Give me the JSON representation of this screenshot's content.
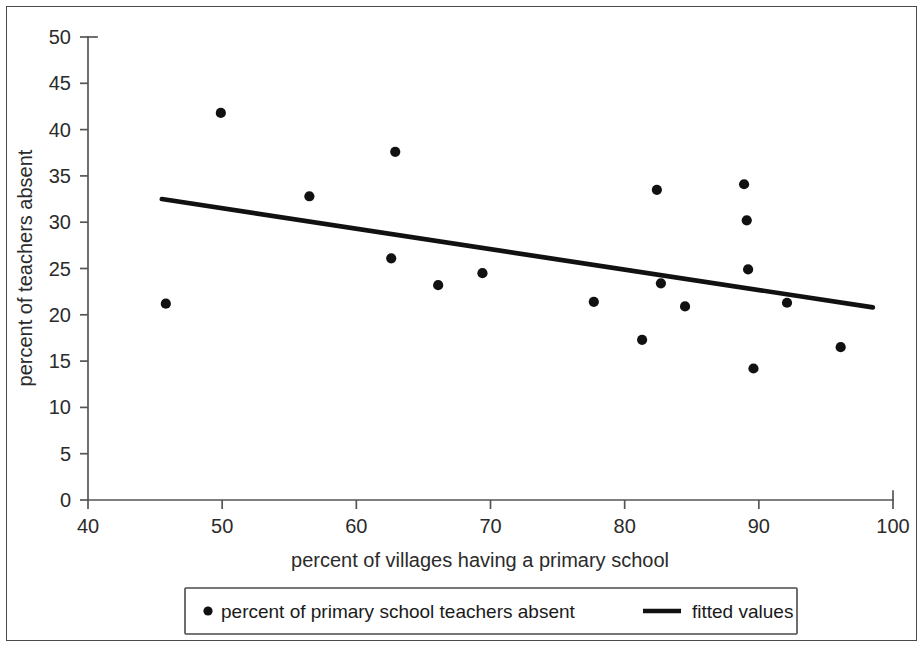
{
  "chart_data": {
    "type": "scatter",
    "title": "",
    "subtitle": "",
    "xlabel": "percent of villages having a primary school",
    "ylabel": "percent of teachers absent",
    "xlim": [
      40,
      100
    ],
    "ylim": [
      0,
      50
    ],
    "xticks": [
      40,
      50,
      60,
      70,
      80,
      90,
      100
    ],
    "yticks": [
      0,
      5,
      10,
      15,
      20,
      25,
      30,
      35,
      40,
      45,
      50
    ],
    "grid": false,
    "legend_position": "below-axis-centered",
    "series": [
      {
        "name": "percent of primary school teachers absent",
        "type": "scatter",
        "marker": "circle",
        "color": "#111111",
        "points": [
          {
            "x": 45.8,
            "y": 21.2
          },
          {
            "x": 49.9,
            "y": 41.8
          },
          {
            "x": 56.5,
            "y": 32.8
          },
          {
            "x": 62.9,
            "y": 37.6
          },
          {
            "x": 62.6,
            "y": 26.1
          },
          {
            "x": 66.1,
            "y": 23.2
          },
          {
            "x": 69.4,
            "y": 24.5
          },
          {
            "x": 77.7,
            "y": 21.4
          },
          {
            "x": 81.3,
            "y": 17.3
          },
          {
            "x": 82.4,
            "y": 33.5
          },
          {
            "x": 82.7,
            "y": 23.4
          },
          {
            "x": 84.5,
            "y": 20.9
          },
          {
            "x": 88.9,
            "y": 34.1
          },
          {
            "x": 89.1,
            "y": 30.2
          },
          {
            "x": 89.2,
            "y": 24.9
          },
          {
            "x": 89.6,
            "y": 14.2
          },
          {
            "x": 92.1,
            "y": 21.3
          },
          {
            "x": 96.1,
            "y": 16.5
          }
        ]
      },
      {
        "name": "fitted values",
        "type": "line",
        "color": "#111111",
        "endpoints": [
          {
            "x": 45.5,
            "y": 32.5
          },
          {
            "x": 98.5,
            "y": 20.8
          }
        ]
      }
    ]
  },
  "axes": {
    "y_title": "percent of teachers absent",
    "x_title": "percent of villages having a primary school",
    "y_tick_labels": [
      "50",
      "45",
      "40",
      "35",
      "30",
      "25",
      "20",
      "15",
      "10",
      "5",
      "0"
    ],
    "x_tick_labels": [
      "40",
      "50",
      "60",
      "70",
      "80",
      "90",
      "100"
    ]
  },
  "legend": {
    "entries": [
      {
        "marker": "dot",
        "label": "percent of primary school teachers absent"
      },
      {
        "marker": "line",
        "label": "fitted values"
      }
    ]
  },
  "colors": {
    "marker": "#111111",
    "line": "#111111",
    "axis": "#555555",
    "frame": "#4a4a4a",
    "text": "#2b2b2b",
    "background": "#ffffff"
  }
}
